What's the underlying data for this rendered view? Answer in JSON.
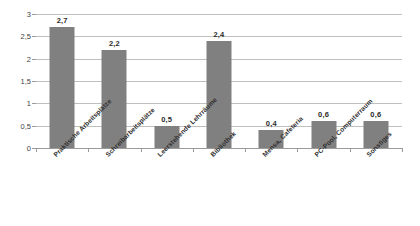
{
  "chart_data": {
    "type": "bar",
    "title": "",
    "subtitle": "",
    "xlabel": "",
    "ylabel": "",
    "categories": [
      "Praktische Arbeitsplätze",
      "Schreibarbeitsplätze",
      "Leerstehende Lehrräume",
      "Bibliothek",
      "Mensa, Cafeteria",
      "PC-Pool, Computerraum",
      "Sonstiges"
    ],
    "values": [
      2.7,
      2.2,
      0.5,
      2.4,
      0.4,
      0.6,
      0.6
    ],
    "value_labels": [
      "2,7",
      "2,2",
      "0,5",
      "2,4",
      "0,4",
      "0,6",
      "0,6"
    ],
    "ylim": [
      0,
      3
    ],
    "ytick_values": [
      0,
      0.5,
      1,
      1.5,
      2,
      2.5,
      3
    ],
    "ytick_labels": [
      "0",
      "0,5",
      "1",
      "1,5",
      "2",
      "2,5",
      "3"
    ],
    "grid": true,
    "legend": false,
    "legend_position": "none",
    "bar_color": "#808080",
    "gridline_color": "#bfbfbf",
    "axis_color": "#9a9a9a",
    "background_color": "#ffffff",
    "decimal_separator": ","
  }
}
